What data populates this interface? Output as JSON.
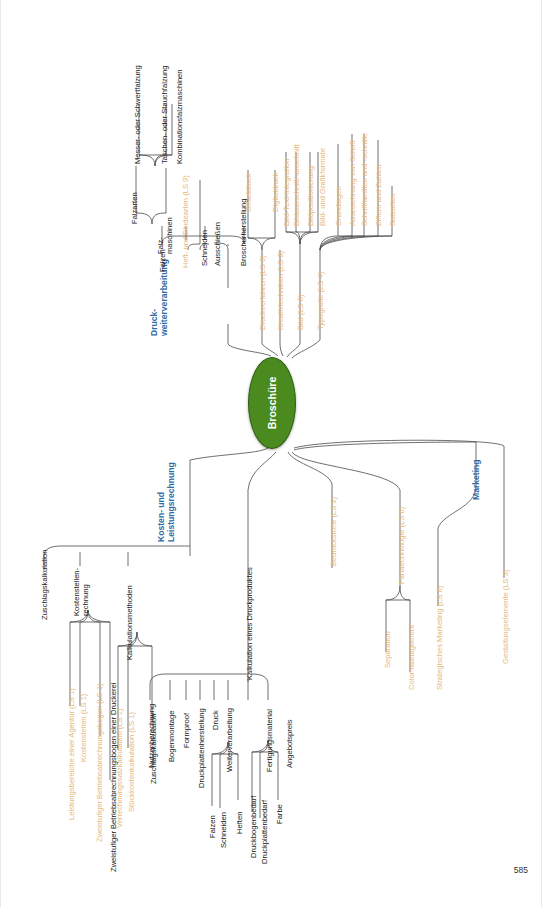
{
  "page": {
    "number": "585"
  },
  "center": {
    "label": "Broschüre",
    "color": "#4a8a1e"
  },
  "colors": {
    "main_branch": "#2e6da4",
    "ls_reference": "#e8b87a",
    "node": "#202020"
  },
  "branches": {
    "druckweiterverarbeitung": {
      "label": "Druck-\nweiterverarbeitung",
      "children": {
        "falzen": {
          "label": "Falzen"
        },
        "falzarten": {
          "label": "Falzarten"
        },
        "falzmaschinen": {
          "label": "Falz-\nmaschinen"
        },
        "messer": {
          "label": "Messer- oder Schwertfalzung"
        },
        "taschen": {
          "label": "Taschen- oder Stauchfalzung"
        },
        "kombination": {
          "label": "Kombinationsfalzmaschinen"
        },
        "heft_binde": {
          "label": "Heft- und Bindearten (LS 9)"
        },
        "schneiden": {
          "label": "Schneiden"
        },
        "ausschiessen": {
          "label": "Ausschießen"
        },
        "broschurherstellung": {
          "label": "Broschurherstellung"
        }
      }
    },
    "druckverfahren": {
      "label": "Druckverfahren (LS 6)",
      "children": {
        "offsetdruck": {
          "label": "Offsetdruck"
        },
        "digitaldruck": {
          "label": "Digitaldruck"
        }
      }
    },
    "kreativtechniken": {
      "label": "Kreativtechniken (LS 3)"
    },
    "bild": {
      "label": "Bild (LS 8)",
      "children": {
        "bild_text": {
          "label": "Bild-Text-Integration"
        },
        "bildausschnitt": {
          "label": "Bildausschnitt/-anschnitt"
        },
        "bildpositionierung": {
          "label": "Bildpositionierung"
        },
        "bildformate": {
          "label": "Bild- und Grafikformate"
        }
      }
    },
    "typografie": {
      "label": "Typografie (LS 4)",
      "children": {
        "grundlagen": {
          "label": "Grundlagen"
        },
        "auszeichnung": {
          "label": "Auszeichnung von Schrift"
        },
        "schriftfamilien": {
          "label": "Schriftfamilien und -schnitte"
        },
        "ziffern": {
          "label": "Ziffern und Zahlen"
        },
        "satzarten": {
          "label": "Satzarten"
        }
      }
    },
    "kosten": {
      "label": "Kosten- und\nLeistungsrechnung",
      "children": {
        "zuschlagskalkulation_top": {
          "label": "Zuschlagskalkulation"
        },
        "kostenstellenrechnung": {
          "label": "Kostenstellen-\nrechnung",
          "children": {
            "leistungsbereiche": {
              "label": "Leistungsbereiche einer Agentur (LS 1)"
            },
            "kostenstellen": {
              "label": "Kostenstellen (LS 1)"
            },
            "bab": {
              "label": "Zweistufiger Betriebsabrechnungsbogen (LS 1)"
            },
            "bab_druckerei": {
              "label": "Zweistufiger Betriebsabrechnungsbogen einer Druckerei"
            }
          }
        },
        "kalkulationsmethoden": {
          "label": "Kalkulationsmethoden",
          "children": {
            "verrechnungssatz": {
              "label": "Verrechnungssatzkalkulation (LS 1)"
            },
            "stueckkosten": {
              "label": "Stückkostenkalkulation (LS 1)"
            },
            "zuschlag": {
              "label": "Zuschlagskalkulation"
            }
          }
        },
        "kalkulation_druckprodukt": {
          "label": "Kalkulation eines Druckproduktes",
          "children": {
            "nutzenberechnung": {
              "label": "Nutzenberechnung"
            },
            "bogenmontage": {
              "label": "Bogenmontage"
            },
            "formproof": {
              "label": "Formproof"
            },
            "druckplattenherstellung": {
              "label": "Druckplattenherstellung"
            },
            "druck": {
              "label": "Druck"
            },
            "weiterverarbeitung": {
              "label": "Weiterverarbeitung",
              "children": {
                "falzen": {
                  "label": "Falzen"
                },
                "schneiden": {
                  "label": "Schneiden"
                },
                "heften": {
                  "label": "Heften"
                }
              }
            },
            "fertigungsmaterial": {
              "label": "Fertigungsmaterial",
              "children": {
                "druckbogenbedarf": {
                  "label": "Druckbogenbedarf"
                },
                "druckplattenbedarf": {
                  "label": "Druckplattenbedarf"
                },
                "farbe": {
                  "label": "Farbe"
                }
              }
            },
            "angebotspreis": {
              "label": "Angebotspreis"
            }
          }
        }
      }
    },
    "bedruckstoffe": {
      "label": "Bedruckstoffe (LS 9)"
    },
    "farbtechnologie": {
      "label": "Farbtechnologie (LS 6)",
      "children": {
        "separation": {
          "label": "Separation"
        },
        "color_management": {
          "label": "Color-Management"
        }
      }
    },
    "marketing": {
      "label": "Marketing",
      "children": {
        "strategisches": {
          "label": "Strategisches Marketing (LS 6)"
        }
      }
    },
    "gestaltungselemente": {
      "label": "Gestaltungselemente (LS 3)"
    }
  }
}
